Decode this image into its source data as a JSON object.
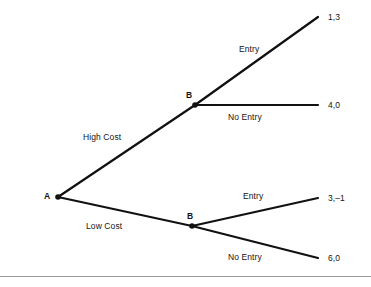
{
  "figure": {
    "type": "extensive-form-game-tree",
    "nodes": [
      {
        "id": "A",
        "label": "A",
        "x": 58,
        "y": 197,
        "label_x": 44,
        "label_y": 191
      },
      {
        "id": "B_upper",
        "label": "B",
        "x": 195,
        "y": 105,
        "label_x": 186,
        "label_y": 90
      },
      {
        "id": "B_lower",
        "label": "B",
        "x": 192,
        "y": 226,
        "label_x": 187,
        "label_y": 211
      }
    ],
    "branches": [
      {
        "id": "high-cost",
        "label": "High Cost",
        "from": "A",
        "to": "B_upper",
        "x1": 58,
        "y1": 197,
        "x2": 195,
        "y2": 105,
        "label_x": 83,
        "label_y": 132
      },
      {
        "id": "low-cost",
        "label": "Low Cost",
        "from": "A",
        "to": "B_lower",
        "x1": 58,
        "y1": 197,
        "x2": 192,
        "y2": 226,
        "label_x": 86,
        "label_y": 221
      },
      {
        "id": "entry-upper",
        "label": "Entry",
        "from": "B_upper",
        "to": "payoff-1-3",
        "x1": 195,
        "y1": 105,
        "x2": 318,
        "y2": 17,
        "label_x": 239,
        "label_y": 44
      },
      {
        "id": "no-entry-upper",
        "label": "No Entry",
        "from": "B_upper",
        "to": "payoff-4-0",
        "x1": 195,
        "y1": 105,
        "x2": 318,
        "y2": 105,
        "label_x": 228,
        "label_y": 112
      },
      {
        "id": "entry-lower",
        "label": "Entry",
        "from": "B_lower",
        "to": "payoff-3-m1",
        "x1": 192,
        "y1": 226,
        "x2": 318,
        "y2": 198,
        "label_x": 243,
        "label_y": 191
      },
      {
        "id": "no-entry-lower",
        "label": "No Entry",
        "from": "B_lower",
        "to": "payoff-6-0",
        "x1": 192,
        "y1": 226,
        "x2": 318,
        "y2": 258,
        "label_x": 228,
        "label_y": 252
      }
    ],
    "payoffs": [
      {
        "id": "payoff-1-3",
        "label": "1,3",
        "x": 328,
        "y": 12
      },
      {
        "id": "payoff-4-0",
        "label": "4,0",
        "x": 328,
        "y": 100
      },
      {
        "id": "payoff-3-m1",
        "label": "3,–1",
        "x": 328,
        "y": 193
      },
      {
        "id": "payoff-6-0",
        "label": "6,0",
        "x": 328,
        "y": 253
      }
    ],
    "style": {
      "line_color": "#111111",
      "line_width": 2.2,
      "node_dot_color": "#111111",
      "node_dot_radius": 2.6,
      "text_color": "#141414",
      "rule_color": "#9a9a9a",
      "background": "#ffffff"
    }
  }
}
